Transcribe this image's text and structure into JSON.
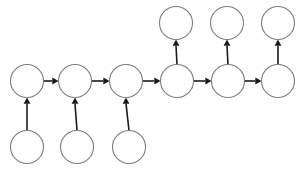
{
  "diagram": {
    "type": "directed-graph",
    "canvas": {
      "width": 303,
      "height": 170,
      "background": "#ffffff"
    },
    "style": {
      "node_fill": "#ffffff",
      "node_stroke": "#7d7d7d",
      "node_stroke_width": 1.1,
      "node_radius": 16.5,
      "edge_color": "#1a1a1a",
      "edge_width": 1.6,
      "arrowhead": "filled-triangle"
    },
    "rows": {
      "top_row_y": 23,
      "middle_row_y": 81,
      "bottom_row_y": 147
    },
    "nodes": [
      {
        "id": "m1",
        "row": "middle",
        "index": 1,
        "label": "",
        "cx": 27,
        "cy": 81,
        "r": 16.5
      },
      {
        "id": "m2",
        "row": "middle",
        "index": 2,
        "label": "",
        "cx": 75,
        "cy": 81,
        "r": 16.5
      },
      {
        "id": "m3",
        "row": "middle",
        "index": 3,
        "label": "",
        "cx": 126,
        "cy": 81,
        "r": 16.5
      },
      {
        "id": "m4",
        "row": "middle",
        "index": 4,
        "label": "",
        "cx": 177,
        "cy": 81,
        "r": 16.5
      },
      {
        "id": "m5",
        "row": "middle",
        "index": 5,
        "label": "",
        "cx": 228,
        "cy": 81,
        "r": 16.5
      },
      {
        "id": "m6",
        "row": "middle",
        "index": 6,
        "label": "",
        "cx": 278,
        "cy": 81,
        "r": 16.5
      },
      {
        "id": "b1",
        "row": "bottom",
        "index": 1,
        "label": "",
        "cx": 27,
        "cy": 147,
        "r": 16.5
      },
      {
        "id": "b2",
        "row": "bottom",
        "index": 2,
        "label": "",
        "cx": 77,
        "cy": 147,
        "r": 16.5
      },
      {
        "id": "b3",
        "row": "bottom",
        "index": 3,
        "label": "",
        "cx": 129,
        "cy": 147,
        "r": 16.5
      },
      {
        "id": "t1",
        "row": "top",
        "index": 1,
        "label": "",
        "cx": 176,
        "cy": 23,
        "r": 16.5
      },
      {
        "id": "t2",
        "row": "top",
        "index": 2,
        "label": "",
        "cx": 227,
        "cy": 23,
        "r": 16.5
      },
      {
        "id": "t3",
        "row": "top",
        "index": 3,
        "label": "",
        "cx": 278,
        "cy": 23,
        "r": 16.5
      }
    ],
    "edges": [
      {
        "id": "e-m1-m2",
        "from": "m1",
        "to": "m2",
        "direction": "right",
        "label": ""
      },
      {
        "id": "e-m2-m3",
        "from": "m2",
        "to": "m3",
        "direction": "right",
        "label": ""
      },
      {
        "id": "e-m3-m4",
        "from": "m3",
        "to": "m4",
        "direction": "right",
        "label": ""
      },
      {
        "id": "e-m4-m5",
        "from": "m4",
        "to": "m5",
        "direction": "right",
        "label": ""
      },
      {
        "id": "e-m5-m6",
        "from": "m5",
        "to": "m6",
        "direction": "right",
        "label": ""
      },
      {
        "id": "e-b1-m1",
        "from": "b1",
        "to": "m1",
        "direction": "up",
        "label": ""
      },
      {
        "id": "e-b2-m2",
        "from": "b2",
        "to": "m2",
        "direction": "up",
        "label": ""
      },
      {
        "id": "e-b3-m3",
        "from": "b3",
        "to": "m3",
        "direction": "up",
        "label": ""
      },
      {
        "id": "e-m4-t1",
        "from": "m4",
        "to": "t1",
        "direction": "up",
        "label": ""
      },
      {
        "id": "e-m5-t2",
        "from": "m5",
        "to": "t2",
        "direction": "up",
        "label": ""
      },
      {
        "id": "e-m6-t3",
        "from": "m6",
        "to": "t3",
        "direction": "up",
        "label": ""
      }
    ]
  }
}
